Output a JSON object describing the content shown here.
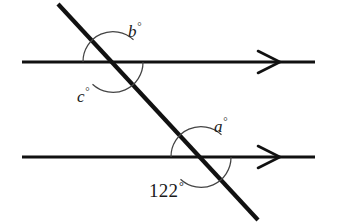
{
  "figure": {
    "kind": "geometry-diagram",
    "background_color": "#ffffff",
    "stroke_color": "#111111",
    "arc_color": "#444444"
  },
  "labels": {
    "angle_b": {
      "symbol": "b",
      "degree": "°"
    },
    "angle_c": {
      "symbol": "c",
      "degree": "°"
    },
    "angle_a": {
      "symbol": "a",
      "degree": "°"
    },
    "angle_known": {
      "value": "122",
      "degree": "°"
    }
  },
  "geometry": {
    "parallel_lines": [
      {
        "name": "top-parallel-line",
        "y": 62,
        "x_start": 22,
        "x_end": 315,
        "arrow_x": 258
      },
      {
        "name": "bottom-parallel-line",
        "y": 157,
        "x_start": 22,
        "x_end": 315,
        "arrow_x": 258
      }
    ],
    "transversal": {
      "x1": 58,
      "y1": 4,
      "x2": 258,
      "y2": 220
    },
    "intersections": [
      {
        "name": "upper-intersection",
        "x": 113,
        "y": 62
      },
      {
        "name": "lower-intersection",
        "x": 201,
        "y": 157
      }
    ],
    "arcs": [
      {
        "name": "arc-b",
        "cx": 113,
        "cy": 62,
        "r": 30,
        "start_deg": 180,
        "end_deg": 313
      },
      {
        "name": "arc-c",
        "cx": 113,
        "cy": 62,
        "r": 30,
        "start_deg": 0,
        "end_deg": 133
      },
      {
        "name": "arc-a",
        "cx": 201,
        "cy": 157,
        "r": 30,
        "start_deg": 180,
        "end_deg": 313
      },
      {
        "name": "arc-122",
        "cx": 201,
        "cy": 157,
        "r": 30,
        "start_deg": 0,
        "end_deg": 133
      }
    ],
    "arrow_marker": {
      "style": "open-chevron",
      "half_width": 11,
      "half_height": 11
    }
  }
}
